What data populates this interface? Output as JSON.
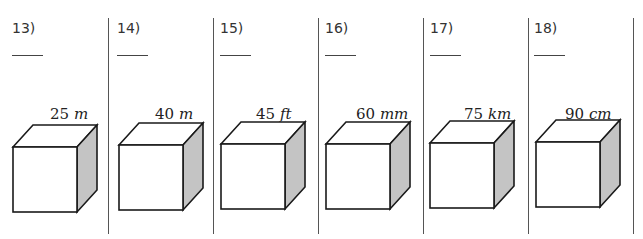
{
  "problems": [
    {
      "number": "13)",
      "value": "25",
      "unit": "m"
    },
    {
      "number": "14)",
      "value": "40",
      "unit": "m"
    },
    {
      "number": "15)",
      "value": "45",
      "unit": "ft"
    },
    {
      "number": "16)",
      "value": "60",
      "unit": "mm"
    },
    {
      "number": "17)",
      "value": "75",
      "unit": "km"
    },
    {
      "number": "18)",
      "value": "90",
      "unit": "cm"
    }
  ],
  "colors": {
    "shaded_face": "#c4c4c4",
    "line": "#1a1a1a"
  }
}
